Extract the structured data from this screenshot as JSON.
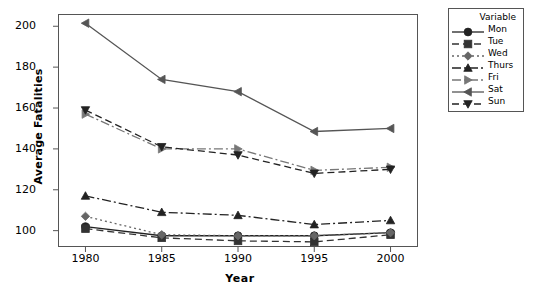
{
  "chart_data": {
    "type": "line",
    "title": "",
    "xlabel": "Year",
    "ylabel": "Average Fatalities",
    "x": [
      1980,
      1985,
      1990,
      1995,
      2000
    ],
    "xticklabels": [
      "1980",
      "1985",
      "1990",
      "1995",
      "2000"
    ],
    "yticklabels": [
      "100",
      "120",
      "140",
      "160",
      "180",
      "200"
    ],
    "yticks": [
      100,
      120,
      140,
      160,
      180,
      200
    ],
    "xlim": [
      1978.2,
      2001.8
    ],
    "ylim": [
      92,
      206
    ],
    "grid": false,
    "legend_position": "right-outside",
    "legend_title": "Variable",
    "series": [
      {
        "name": "Mon",
        "marker": "circle",
        "linestyle": "solid",
        "color": "#222222",
        "values": [
          102,
          97.5,
          97.5,
          97.5,
          99
        ]
      },
      {
        "name": "Tue",
        "marker": "square",
        "linestyle": "dashed",
        "color": "#333333",
        "values": [
          101,
          96.5,
          95,
          94.5,
          98
        ]
      },
      {
        "name": "Wed",
        "marker": "diamond",
        "linestyle": "dotted",
        "color": "#666666",
        "values": [
          107,
          98,
          97.5,
          97.5,
          99
        ]
      },
      {
        "name": "Thurs",
        "marker": "triangle-up",
        "linestyle": "dashdot",
        "color": "#222222",
        "values": [
          117,
          109,
          107.5,
          103,
          105
        ]
      },
      {
        "name": "Fri",
        "marker": "triangle-right",
        "linestyle": "dashdot",
        "color": "#777777",
        "values": [
          157,
          140,
          140,
          129.5,
          131
        ]
      },
      {
        "name": "Sat",
        "marker": "triangle-left",
        "linestyle": "solid",
        "color": "#555555",
        "values": [
          201.5,
          174,
          168,
          148.5,
          150
        ]
      },
      {
        "name": "Sun",
        "marker": "triangle-down",
        "linestyle": "dashed",
        "color": "#222222",
        "values": [
          159,
          141,
          137,
          128,
          130
        ]
      }
    ]
  }
}
